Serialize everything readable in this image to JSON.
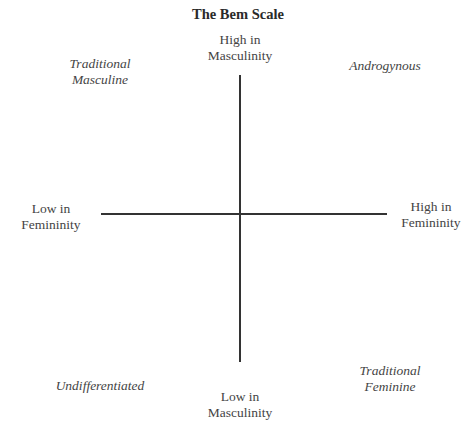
{
  "title": "The Bem Scale",
  "axes": {
    "top": {
      "line1": "High in",
      "line2": "Masculinity"
    },
    "bottom": {
      "line1": "Low in",
      "line2": "Masculinity"
    },
    "left": {
      "line1": "Low in",
      "line2": "Femininity"
    },
    "right": {
      "line1": "High in",
      "line2": "Femininity"
    }
  },
  "quadrants": {
    "top_left": {
      "line1": "Traditional",
      "line2": "Masculine"
    },
    "top_right": {
      "line1": "Androgynous"
    },
    "bottom_left": {
      "line1": "Undifferentiated"
    },
    "bottom_right": {
      "line1": "Traditional",
      "line2": "Feminine"
    }
  },
  "colors": {
    "line": "#333333",
    "text": "#444444"
  }
}
